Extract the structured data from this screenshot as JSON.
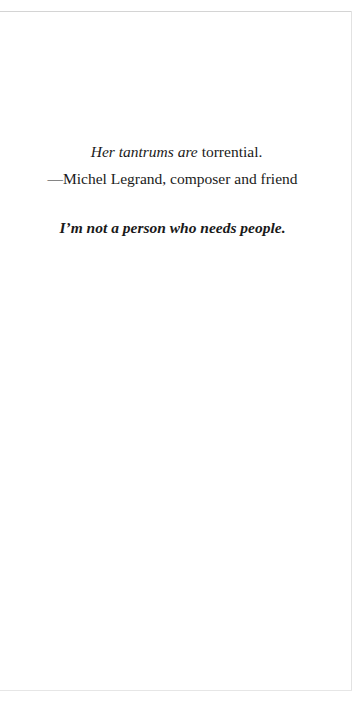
{
  "page": {
    "quote": {
      "italic_part": "Her tantrums are",
      "roman_part": " torrential."
    },
    "attribution": "—Michel Legrand, composer and friend",
    "epigraph": "I’m not a person who needs people."
  },
  "colors": {
    "background": "#ffffff",
    "text": "#1a1a1a",
    "rule": "#d4d4d4"
  }
}
